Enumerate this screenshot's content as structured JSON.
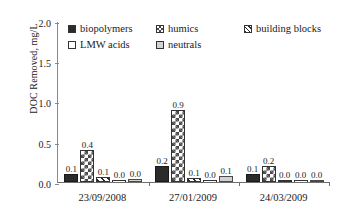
{
  "chart_data": {
    "type": "bar",
    "title": "",
    "xlabel": "",
    "ylabel": "DOC Removed, mg/L",
    "ylim": [
      0,
      2.0
    ],
    "yticks": [
      "0.0",
      "0.5",
      "1.0",
      "1.5",
      "2.0"
    ],
    "grid": false,
    "legend_position": "top-inside",
    "categories": [
      "23/09/2008",
      "27/01/2009",
      "24/03/2009"
    ],
    "series": [
      {
        "name": "biopolymers",
        "fill": "solid",
        "values": [
          0.1,
          0.2,
          0.1
        ],
        "labels": [
          "0.1",
          "0.2",
          "0.1"
        ]
      },
      {
        "name": "humics",
        "fill": "checker",
        "values": [
          0.4,
          0.9,
          0.2
        ],
        "labels": [
          "0.4",
          "0.9",
          "0.2"
        ]
      },
      {
        "name": "building blocks",
        "fill": "diagonal",
        "values": [
          0.06,
          0.05,
          0.02
        ],
        "labels": [
          "0.1",
          "0.1",
          "0.0"
        ]
      },
      {
        "name": "LMW acids",
        "fill": "empty",
        "values": [
          0.0,
          0.0,
          0.0
        ],
        "labels": [
          "0.0",
          "0.0",
          "0.0"
        ]
      },
      {
        "name": "neutrals",
        "fill": "gray",
        "values": [
          0.04,
          0.08,
          0.01
        ],
        "labels": [
          "0.0",
          "0.1",
          "0.0"
        ]
      }
    ]
  },
  "axis": {
    "y_title": "DOC Removed, mg/L",
    "y_ticks": [
      "2.0",
      "1.5",
      "1.0",
      "0.5",
      "0.0"
    ],
    "x_categories": [
      "23/09/2008",
      "27/01/2009",
      "24/03/2009"
    ]
  },
  "legend": {
    "rows": [
      [
        {
          "label": "biopolymers",
          "fill": "solid"
        },
        {
          "label": "humics",
          "fill": "checker"
        },
        {
          "label": "building blocks",
          "fill": "diagonal"
        }
      ],
      [
        {
          "label": "LMW acids",
          "fill": "empty"
        },
        {
          "label": "neutrals",
          "fill": "gray"
        }
      ]
    ]
  },
  "colors": {
    "solid": "#2b2b2b",
    "checker": "#4a4a4a",
    "diagonal": "#2b2b2b",
    "empty": "#ffffff",
    "gray": "#d2d2d2",
    "axis": "#6f6f6f",
    "text": "#1a1a1a"
  }
}
